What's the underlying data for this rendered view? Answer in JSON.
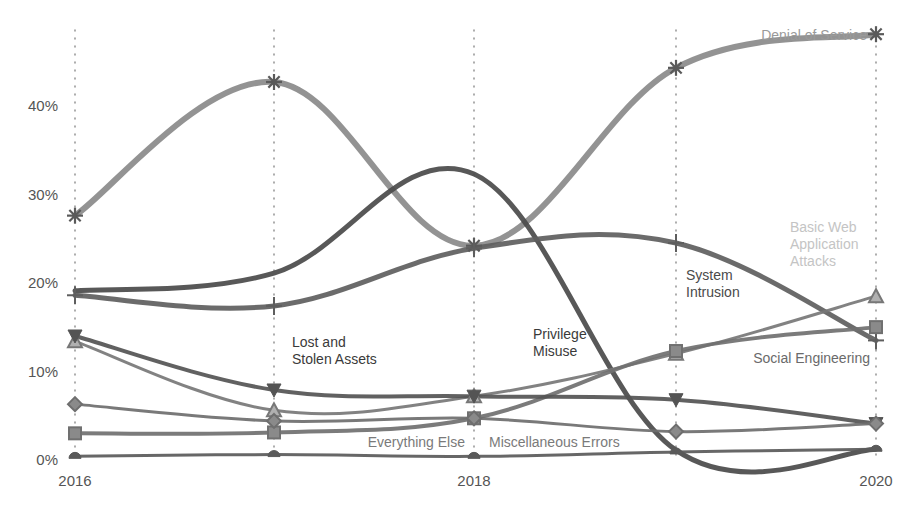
{
  "chart_data": {
    "type": "line",
    "title": "",
    "xlabel": "",
    "ylabel": "",
    "x": [
      2016,
      2017,
      2018,
      2019,
      2020
    ],
    "x_tick_labels": [
      "2016",
      "",
      "2018",
      "",
      "2020"
    ],
    "y_tick_labels": [
      "0%",
      "10%",
      "20%",
      "30%",
      "40%"
    ],
    "y_ticks": [
      0,
      10,
      20,
      30,
      40
    ],
    "ylim": [
      0,
      50
    ],
    "grid": "vertical dotted lines at each year",
    "legend": "inline labels",
    "series": [
      {
        "name": "Denial of Service",
        "marker": "asterisk",
        "color": "#8a8a8a",
        "width": 6,
        "values": [
          27.5,
          42.6,
          24.1,
          44.2,
          48.0
        ]
      },
      {
        "name": "Privilege Misuse",
        "marker": "none",
        "color": "#4a4a4a",
        "width": 5,
        "values": [
          19.0,
          21.0,
          32.2,
          1.0,
          1.1
        ]
      },
      {
        "name": "System Intrusion",
        "marker": "cross",
        "color": "#5e5e5e",
        "width": 5,
        "values": [
          18.5,
          17.3,
          23.8,
          24.4,
          13.4
        ]
      },
      {
        "name": "Basic Web Application Attacks",
        "marker": "triangle",
        "color": "#777777",
        "width": 3,
        "values": [
          13.3,
          5.5,
          7.1,
          11.9,
          18.4
        ]
      },
      {
        "name": "Social Engineering",
        "marker": "square",
        "color": "#707070",
        "width": 4,
        "values": [
          2.9,
          3.0,
          4.6,
          12.2,
          14.9
        ]
      },
      {
        "name": "Lost and Stolen Assets",
        "marker": "triangle-down",
        "color": "#545454",
        "width": 4,
        "values": [
          13.9,
          7.8,
          7.1,
          6.7,
          4.0
        ]
      },
      {
        "name": "Everything Else",
        "marker": "diamond",
        "color": "#6e6e6e",
        "width": 3,
        "values": [
          6.2,
          4.3,
          4.6,
          3.1,
          4.0
        ]
      },
      {
        "name": "Miscellaneous Errors",
        "marker": "circle",
        "color": "#5a5a5a",
        "width": 3,
        "values": [
          0.3,
          0.5,
          0.3,
          0.8,
          1.1
        ]
      }
    ],
    "annotations": [
      {
        "text": [
          "Denial of Service"
        ],
        "x": 867,
        "y": 40,
        "anchor": "end",
        "color": "#9a9a9a"
      },
      {
        "text": [
          "Basic Web",
          "Application",
          "Attacks"
        ],
        "x": 790,
        "y": 232,
        "anchor": "start",
        "color": "#c4c4c4"
      },
      {
        "text": [
          "System",
          "Intrusion"
        ],
        "x": 686,
        "y": 280,
        "anchor": "start",
        "color": "#4a4a4a"
      },
      {
        "text": [
          "Lost and",
          "Stolen Assets"
        ],
        "x": 292,
        "y": 347,
        "anchor": "start",
        "color": "#3a3a3a"
      },
      {
        "text": [
          "Privilege",
          "Misuse"
        ],
        "x": 533,
        "y": 339,
        "anchor": "start",
        "color": "#3a3a3a"
      },
      {
        "text": [
          "Social Engineering"
        ],
        "x": 870,
        "y": 363,
        "anchor": "end",
        "color": "#6a6a6a"
      },
      {
        "text": [
          "Everything Else"
        ],
        "x": 465,
        "y": 447,
        "anchor": "end",
        "color": "#7a7a7a"
      },
      {
        "text": [
          "Miscellaneous Errors"
        ],
        "x": 489,
        "y": 447,
        "anchor": "start",
        "color": "#7a7a7a"
      }
    ]
  },
  "layout": {
    "x_px": [
      75,
      274,
      474,
      676,
      876
    ],
    "y_zero_px": 459,
    "px_per_unit": 8.85,
    "grid_top": 30,
    "grid_bottom": 460
  }
}
